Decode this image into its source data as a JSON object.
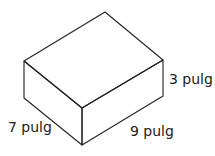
{
  "diagram": {
    "type": "rectangular-prism",
    "labels": {
      "height": "3 pulg",
      "width": "7 pulg",
      "length": "9 pulg"
    },
    "line_color": "#222222"
  }
}
